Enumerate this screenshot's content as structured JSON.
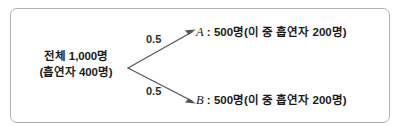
{
  "figure": {
    "kind": "probability-tree-diagram",
    "root": {
      "line1": "전체 1,000명",
      "line2": "(흡연자 400명)"
    },
    "branches": [
      {
        "id": "A",
        "name": "A",
        "separator": ":",
        "probability": "0.5",
        "description": "500명(이 중 흡연자 200명)"
      },
      {
        "id": "B",
        "name": "B",
        "separator": ":",
        "probability": "0.5",
        "description": "500명(이 중 흡연자 200명)"
      }
    ],
    "colors": {
      "background": "#ffffff",
      "border": "#b0b0b0",
      "line": "#555555",
      "text": "#1a1a1a"
    }
  }
}
